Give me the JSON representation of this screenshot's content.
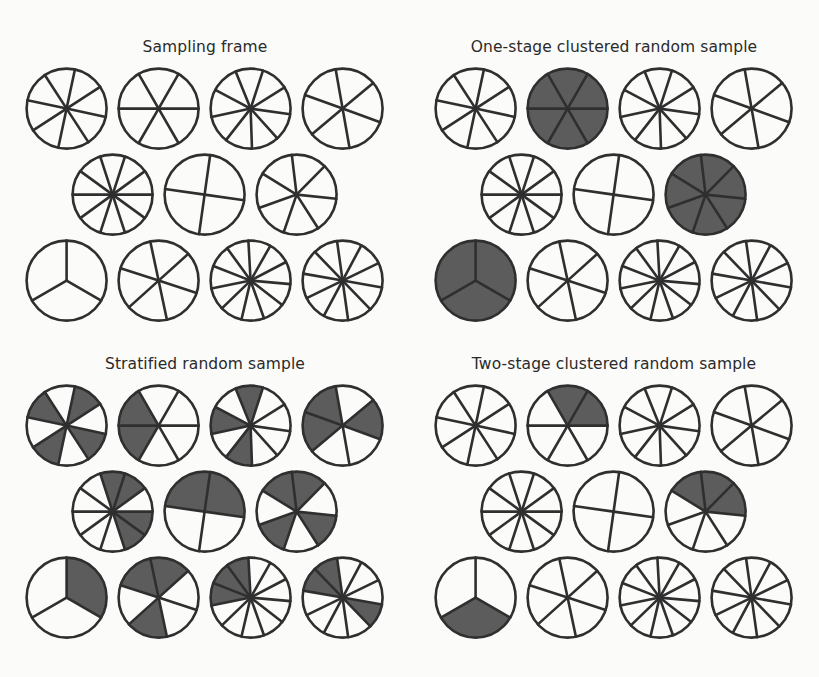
{
  "figure": {
    "background_color": "#fbfbfa",
    "stroke_color": "#2f2f2f",
    "fill_color": "#5c5c5c",
    "unfilled_color": "#fbfbfa",
    "width": 819,
    "height": 677
  },
  "panels": [
    {
      "id": "sampling-frame",
      "title": "Sampling frame",
      "x": 0,
      "y": 38,
      "width": 410,
      "height": 300,
      "rows": [
        {
          "indent": 0,
          "circles": [
            {
              "segments": 8,
              "radius": 40,
              "rotation": 12,
              "filled": []
            },
            {
              "segments": 6,
              "radius": 40,
              "rotation": 0,
              "filled": []
            },
            {
              "segments": 9,
              "radius": 40,
              "rotation": 8,
              "filled": []
            },
            {
              "segments": 6,
              "radius": 40,
              "rotation": 20,
              "filled": []
            }
          ]
        },
        {
          "indent": 1,
          "circles": [
            {
              "segments": 10,
              "radius": 40,
              "rotation": 0,
              "filled": []
            },
            {
              "segments": 4,
              "radius": 40,
              "rotation": 8,
              "filled": []
            },
            {
              "segments": 7,
              "radius": 40,
              "rotation": 6,
              "filled": []
            }
          ]
        },
        {
          "indent": 0,
          "circles": [
            {
              "segments": 3,
              "radius": 40,
              "rotation": 30,
              "filled": []
            },
            {
              "segments": 6,
              "radius": 40,
              "rotation": 18,
              "filled": []
            },
            {
              "segments": 11,
              "radius": 40,
              "rotation": 5,
              "filled": []
            },
            {
              "segments": 10,
              "radius": 40,
              "rotation": 10,
              "filled": []
            }
          ]
        }
      ]
    },
    {
      "id": "one-stage-clustered-random-sample",
      "title": "One-stage clustered random sample",
      "x": 409,
      "y": 38,
      "width": 410,
      "height": 300,
      "rows": [
        {
          "indent": 0,
          "circles": [
            {
              "segments": 8,
              "radius": 40,
              "rotation": 12,
              "filled": []
            },
            {
              "segments": 6,
              "radius": 40,
              "rotation": 0,
              "filled": [
                0,
                1,
                2,
                3,
                4,
                5
              ]
            },
            {
              "segments": 9,
              "radius": 40,
              "rotation": 8,
              "filled": []
            },
            {
              "segments": 6,
              "radius": 40,
              "rotation": 20,
              "filled": []
            }
          ]
        },
        {
          "indent": 1,
          "circles": [
            {
              "segments": 10,
              "radius": 40,
              "rotation": 0,
              "filled": []
            },
            {
              "segments": 4,
              "radius": 40,
              "rotation": 8,
              "filled": []
            },
            {
              "segments": 7,
              "radius": 40,
              "rotation": 6,
              "filled": [
                0,
                1,
                2,
                3,
                4,
                5,
                6
              ]
            }
          ]
        },
        {
          "indent": 0,
          "circles": [
            {
              "segments": 3,
              "radius": 40,
              "rotation": 30,
              "filled": [
                0,
                1,
                2
              ]
            },
            {
              "segments": 6,
              "radius": 40,
              "rotation": 18,
              "filled": []
            },
            {
              "segments": 11,
              "radius": 40,
              "rotation": 5,
              "filled": []
            },
            {
              "segments": 10,
              "radius": 40,
              "rotation": 10,
              "filled": []
            }
          ]
        }
      ]
    },
    {
      "id": "stratified-random-sample",
      "title": "Stratified random sample",
      "x": 0,
      "y": 355,
      "width": 410,
      "height": 305,
      "rows": [
        {
          "indent": 0,
          "circles": [
            {
              "segments": 8,
              "radius": 40,
              "rotation": 12,
              "filled": [
                0,
                2,
                4,
                6
              ]
            },
            {
              "segments": 6,
              "radius": 40,
              "rotation": 0,
              "filled": [
                2,
                3
              ]
            },
            {
              "segments": 9,
              "radius": 40,
              "rotation": 8,
              "filled": [
                2,
                4,
                6
              ]
            },
            {
              "segments": 6,
              "radius": 40,
              "rotation": 20,
              "filled": [
                2,
                3,
                5
              ]
            }
          ]
        },
        {
          "indent": 1,
          "circles": [
            {
              "segments": 10,
              "radius": 40,
              "rotation": 0,
              "filled": [
                0,
                1,
                7,
                8
              ]
            },
            {
              "segments": 4,
              "radius": 40,
              "rotation": 8,
              "filled": [
                2,
                3
              ]
            },
            {
              "segments": 7,
              "radius": 40,
              "rotation": 6,
              "filled": [
                0,
                2,
                4,
                5
              ]
            }
          ]
        },
        {
          "indent": 0,
          "circles": [
            {
              "segments": 3,
              "radius": 40,
              "rotation": 30,
              "filled": [
                2
              ]
            },
            {
              "segments": 6,
              "radius": 40,
              "rotation": 18,
              "filled": [
                1,
                3,
                4
              ]
            },
            {
              "segments": 11,
              "radius": 40,
              "rotation": 5,
              "filled": [
                5,
                6,
                7
              ]
            },
            {
              "segments": 10,
              "radius": 40,
              "rotation": 10,
              "filled": [
                0,
                5,
                6
              ]
            }
          ]
        }
      ]
    },
    {
      "id": "two-stage-clustered-random-sample",
      "title": "Two-stage clustered random sample",
      "x": 409,
      "y": 355,
      "width": 410,
      "height": 305,
      "rows": [
        {
          "indent": 0,
          "circles": [
            {
              "segments": 8,
              "radius": 40,
              "rotation": 12,
              "filled": []
            },
            {
              "segments": 6,
              "radius": 40,
              "rotation": 0,
              "filled": [
                4,
                5
              ]
            },
            {
              "segments": 9,
              "radius": 40,
              "rotation": 8,
              "filled": []
            },
            {
              "segments": 6,
              "radius": 40,
              "rotation": 20,
              "filled": []
            }
          ]
        },
        {
          "indent": 1,
          "circles": [
            {
              "segments": 10,
              "radius": 40,
              "rotation": 0,
              "filled": []
            },
            {
              "segments": 4,
              "radius": 40,
              "rotation": 8,
              "filled": []
            },
            {
              "segments": 7,
              "radius": 40,
              "rotation": 6,
              "filled": [
                4,
                5,
                6
              ]
            }
          ]
        },
        {
          "indent": 0,
          "circles": [
            {
              "segments": 3,
              "radius": 40,
              "rotation": 30,
              "filled": [
                0
              ]
            },
            {
              "segments": 6,
              "radius": 40,
              "rotation": 18,
              "filled": []
            },
            {
              "segments": 11,
              "radius": 40,
              "rotation": 5,
              "filled": []
            },
            {
              "segments": 10,
              "radius": 40,
              "rotation": 10,
              "filled": []
            }
          ]
        }
      ]
    }
  ],
  "layout": {
    "row_height": 86,
    "cell_width": 92,
    "indent_offset": 46,
    "stroke_width": 2.6
  }
}
